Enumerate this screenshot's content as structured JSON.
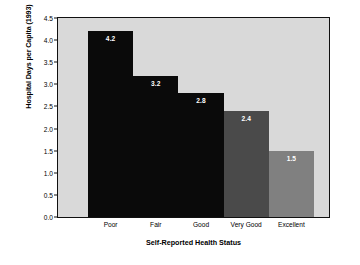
{
  "chart_data": {
    "type": "bar",
    "title": "",
    "xlabel": "Self-Reported Health Status",
    "ylabel": "Hospital Days per Capita (1993)",
    "categories": [
      "Poor",
      "Fair",
      "Good",
      "Very Good",
      "Excellent"
    ],
    "values": [
      4.2,
      3.2,
      2.8,
      2.4,
      1.5
    ],
    "value_labels": [
      "4.2",
      "3.2",
      "2.8",
      "2.4",
      "1.5"
    ],
    "bar_colors": [
      "#0a0a0a",
      "#0a0a0a",
      "#0a0a0a",
      "#4a4a4a",
      "#808080"
    ],
    "ylim": [
      0.0,
      4.5
    ],
    "ytick_values": [
      0.0,
      0.5,
      1.0,
      1.5,
      2.0,
      2.5,
      3.0,
      3.5,
      4.0,
      4.5
    ],
    "ytick_labels": [
      "0.0",
      "0.5",
      "1.0",
      "1.5",
      "2.0",
      "2.5",
      "3.0",
      "3.5",
      "4.0",
      "4.5"
    ],
    "grid": false,
    "legend": "none",
    "plot_background": "#d9d9d9",
    "page_background": "#ffffff",
    "label_color": "#ffffff",
    "bar_gap": 0
  }
}
